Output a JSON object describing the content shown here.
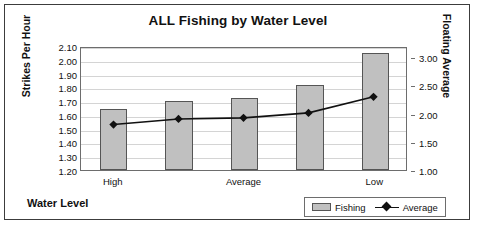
{
  "chart_data": {
    "type": "bar",
    "title": "ALL Fishing by Water Level",
    "xlabel": "Water Level",
    "ylabel": "Strikes Per Hour",
    "y2label": "Floating Average",
    "categories": [
      "High",
      "",
      "Average",
      "",
      "Low"
    ],
    "grid": true,
    "legend_position": "bottom-right",
    "ylim": [
      1.2,
      2.1
    ],
    "y2lim": [
      1.0,
      3.2
    ],
    "yticks": [
      "1.20",
      "1.30",
      "1.40",
      "1.50",
      "1.60",
      "1.70",
      "1.80",
      "1.90",
      "2.00",
      "2.10"
    ],
    "y2ticks": [
      "1.00",
      "1.50",
      "2.00",
      "2.50",
      "3.00"
    ],
    "series": [
      {
        "name": "Fishing",
        "type": "bar",
        "axis": "left",
        "color": "#c0c0c0",
        "values": [
          1.645,
          1.7,
          1.72,
          1.815,
          2.05
        ]
      },
      {
        "name": "Average",
        "type": "line",
        "axis": "right",
        "color": "#111111",
        "marker": "diamond",
        "values": [
          1.82,
          1.92,
          1.94,
          2.03,
          2.32
        ]
      }
    ]
  },
  "chart": {
    "title": "ALL Fishing by Water Level",
    "x_axis_title": "Water Level",
    "y_axis_title": "Strikes Per Hour",
    "y2_axis_title": "Floating Average",
    "legend": {
      "bar_series_label": "Fishing",
      "line_series_label": "Average"
    }
  }
}
